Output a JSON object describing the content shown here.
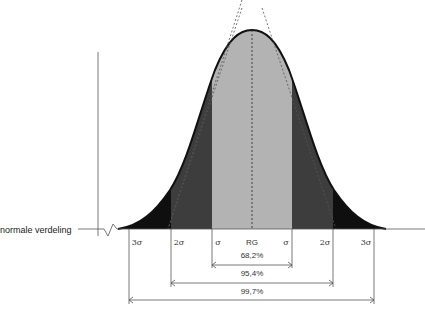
{
  "diagram": {
    "axis_label": "normale verdeling",
    "sigma_labels": {
      "neg3": "3σ",
      "neg2": "2σ",
      "neg1": "σ",
      "center": "RG",
      "pos1": "σ",
      "pos2": "2σ",
      "pos3": "3σ"
    },
    "ranges": [
      {
        "label": "68,2%",
        "span": "±1σ"
      },
      {
        "label": "95,4%",
        "span": "±2σ"
      },
      {
        "label": "99,7%",
        "span": "±3σ"
      }
    ],
    "colors": {
      "band_1sigma": "#b3b3b3",
      "band_2sigma": "#3d3d3d",
      "band_3sigma": "#0f0f0f",
      "curve": "#111111",
      "axis": "#555555"
    }
  }
}
